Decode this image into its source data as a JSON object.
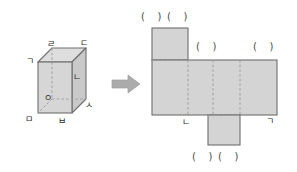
{
  "figure": {
    "title": "",
    "background_color": "#ffffff",
    "face_fill": "#d4d4d4",
    "face_fill_light": "#dcdcdc",
    "face_fill_dark": "#c4c4c4",
    "edge_color": "#6e6e6e",
    "hidden_edge_color": "#9a9a9a",
    "label_color": "#2b2b2b",
    "arrow_color": "#a8a8a8"
  },
  "solid": {
    "name": "rectangular-prism",
    "vertex_labels": {
      "top_back_left": "ㄹ",
      "top_back_right": "ㄷ",
      "top_front_left": "ㄱ",
      "top_front_right": "ㄴ",
      "bottom_front_left": "ㅁ",
      "bottom_front_right": "ㅂ",
      "bottom_back_right": "ㅅ",
      "bottom_back_left": "ㅇ"
    },
    "labels_list": [
      "ㄹ",
      "ㄷ",
      "ㄱ",
      "ㄴ",
      "ㅇ",
      "ㅅ",
      "ㅁ",
      "ㅂ"
    ]
  },
  "arrow": {
    "direction": "right",
    "glyph": "arrow-right-icon"
  },
  "net": {
    "name": "cube-net",
    "blanks": {
      "top_left": "(    )",
      "top_right": "(    )",
      "mid_left": "(    )",
      "mid_right": "(    )",
      "bottom_left": "(    )",
      "bottom_right": "(    )"
    },
    "given_labels": {
      "bottom_left_vertex": "ㄴ",
      "bottom_right_vertex": "ㄱ"
    }
  }
}
